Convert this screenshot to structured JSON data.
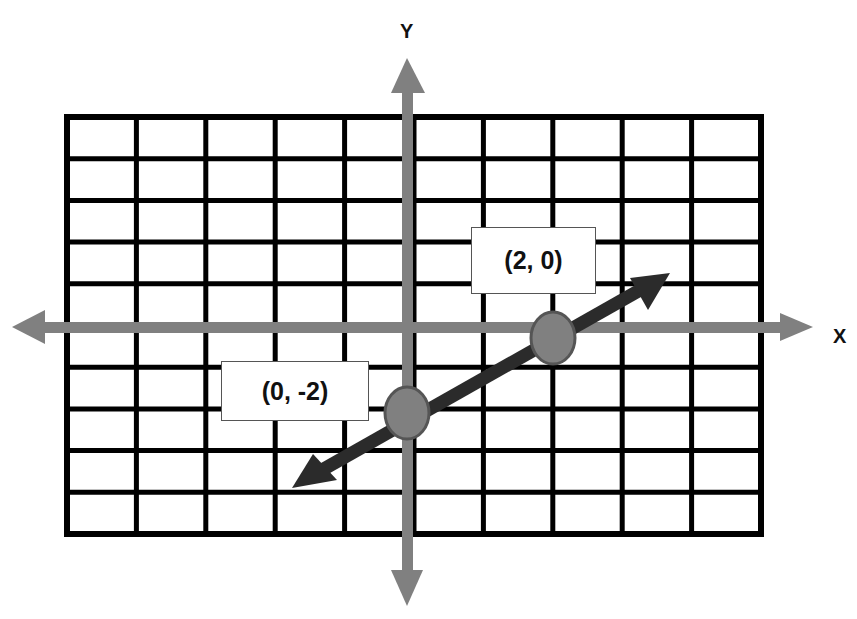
{
  "diagram": {
    "title": "",
    "axes": {
      "x_label": "X",
      "y_label": "Y",
      "color": "#808080"
    },
    "grid": {
      "columns": 10,
      "rows": 10,
      "line_color": "#000000",
      "background": "#ffffff"
    },
    "line": {
      "color": "#2b2b2b",
      "description": "double-headed arrow line through the two labeled points"
    },
    "points": [
      {
        "label": "(2, 0)",
        "x": 2,
        "y": 0,
        "fill": "#808080",
        "stroke": "#555555"
      },
      {
        "label": "(0, -2)",
        "x": 0,
        "y": -2,
        "fill": "#808080",
        "stroke": "#555555"
      }
    ]
  }
}
